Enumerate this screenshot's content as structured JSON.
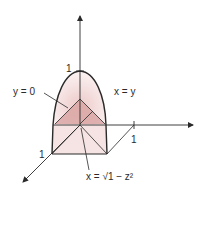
{
  "figure": {
    "type": "3d-solid-region-sketch",
    "colors": {
      "ink": "#2a2a2a",
      "fill_light": "#f6e3e3",
      "fill_mid": "#ecc9c8",
      "fill_dark": "#d9a6a4"
    },
    "axes": {
      "vertical_tick_label": "1",
      "horizontal_tick_label": "1",
      "depth_tick_label": "1"
    },
    "labels": {
      "plane_y0": "y = 0",
      "plane_xy": "x = y",
      "surface": "x = √1 − z²"
    }
  }
}
